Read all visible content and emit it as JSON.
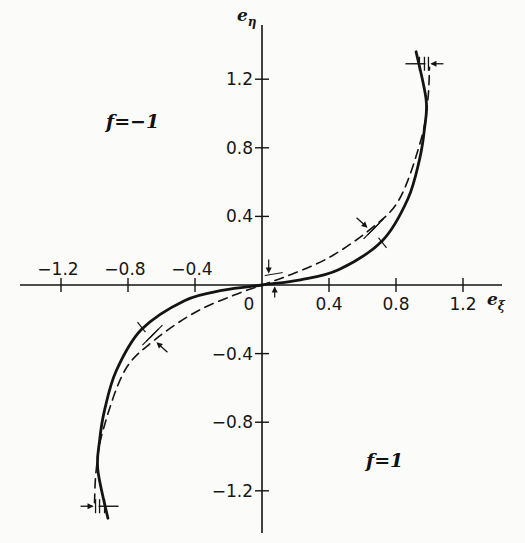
{
  "chart_data": {
    "type": "line",
    "title": "",
    "xlabel": "e_ξ",
    "ylabel": "e_η",
    "xlim": [
      -1.2,
      1.4
    ],
    "ylim": [
      -1.45,
      1.45
    ],
    "grid": false,
    "x_ticks": [
      -1.2,
      -0.8,
      -0.4,
      0,
      0.4,
      0.8,
      1.2
    ],
    "x_tick_labels": [
      "−1.2",
      "−0.8",
      "−0.4",
      "0",
      "0.4",
      "0.8",
      "1.2"
    ],
    "y_ticks": [
      1.2,
      0.8,
      0.4,
      -0.4,
      -0.8,
      -1.2
    ],
    "y_tick_labels": [
      "1.2",
      "0.8",
      "0.4",
      "−0.4",
      "−0.8",
      "−1.2"
    ],
    "annotations": [
      {
        "text": "f=−1",
        "x": -1.05,
        "y": 0.95
      },
      {
        "text": "f=1",
        "x": 0.62,
        "y": -0.95
      }
    ],
    "series": [
      {
        "name": "solid curve",
        "style": "solid",
        "points": [
          [
            -0.92,
            -1.36
          ],
          [
            -0.98,
            -1.08
          ],
          [
            -0.97,
            -0.91
          ],
          [
            -0.94,
            -0.73
          ],
          [
            -0.87,
            -0.5
          ],
          [
            -0.72,
            -0.26
          ],
          [
            -0.46,
            -0.09
          ],
          [
            -0.23,
            -0.03
          ],
          [
            0,
            0
          ],
          [
            0.23,
            0.03
          ],
          [
            0.46,
            0.09
          ],
          [
            0.72,
            0.26
          ],
          [
            0.87,
            0.5
          ],
          [
            0.94,
            0.73
          ],
          [
            0.97,
            0.91
          ],
          [
            0.98,
            1.08
          ],
          [
            0.92,
            1.36
          ]
        ]
      },
      {
        "name": "dashed curve",
        "style": "dashed",
        "points": [
          [
            -1.0,
            -1.27
          ],
          [
            -0.99,
            -1.08
          ],
          [
            -0.95,
            -0.85
          ],
          [
            -0.82,
            -0.5
          ],
          [
            -0.64,
            -0.32
          ],
          [
            -0.4,
            -0.16
          ],
          [
            -0.17,
            -0.06
          ],
          [
            0,
            0
          ],
          [
            0.17,
            0.06
          ],
          [
            0.4,
            0.16
          ],
          [
            0.64,
            0.32
          ],
          [
            0.82,
            0.5
          ],
          [
            0.95,
            0.85
          ],
          [
            0.99,
            1.08
          ],
          [
            1.0,
            1.27
          ]
        ]
      }
    ],
    "markers": [
      {
        "type": "crossing-arrow",
        "x": 0.94,
        "y": 1.29,
        "arrow_dir": "left"
      },
      {
        "type": "crossing-arrow",
        "x": 0.66,
        "y": 0.31,
        "arrow_dir": "down-right"
      },
      {
        "type": "crossing-arrow",
        "x": 0.04,
        "y": 0.02,
        "arrow_dir": "vertical"
      },
      {
        "type": "crossing-arrow",
        "x": -0.66,
        "y": -0.31,
        "arrow_dir": "up-left"
      },
      {
        "type": "crossing-arrow",
        "x": -0.94,
        "y": -1.29,
        "arrow_dir": "right"
      }
    ]
  },
  "labels": {
    "x_axis": "e",
    "x_axis_sub": "ξ",
    "y_axis": "e",
    "y_axis_sub": "η",
    "region_top_left": "f=−1",
    "region_bottom_right": "f=1"
  },
  "colors": {
    "ink": "#141414",
    "background": "#fbfbfa"
  }
}
